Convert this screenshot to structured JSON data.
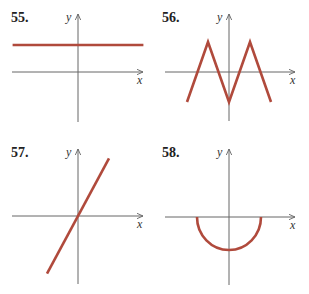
{
  "colors": {
    "curve": "#b04a3c",
    "axis": "#666666",
    "text": "#222222"
  },
  "chart_data": [
    {
      "type": "line",
      "panel_label": "55.",
      "xlabel": "x",
      "ylabel": "y",
      "description": "horizontal line above the x-axis",
      "xlim": [
        -3,
        3
      ],
      "ylim": [
        -2,
        2
      ],
      "points": [
        [
          -3,
          1
        ],
        [
          3,
          1
        ]
      ],
      "grid": false
    },
    {
      "type": "line",
      "panel_label": "56.",
      "xlabel": "x",
      "ylabel": "y",
      "description": "zigzag (M-shaped) piecewise linear graph",
      "xlim": [
        -3,
        3
      ],
      "ylim": [
        -2,
        2
      ],
      "points": [
        [
          -2,
          -1
        ],
        [
          -1,
          1
        ],
        [
          0,
          -1
        ],
        [
          1,
          1
        ],
        [
          2,
          -1
        ]
      ],
      "grid": false
    },
    {
      "type": "line",
      "panel_label": "57.",
      "xlabel": "x",
      "ylabel": "y",
      "description": "straight line through the origin with positive slope",
      "xlim": [
        -3,
        3
      ],
      "ylim": [
        -2.5,
        2.5
      ],
      "points": [
        [
          -1,
          -1.8
        ],
        [
          1,
          1.8
        ]
      ],
      "grid": false
    },
    {
      "type": "line",
      "panel_label": "58.",
      "xlabel": "x",
      "ylabel": "y",
      "description": "lower semicircle centered at origin",
      "xlim": [
        -3,
        3
      ],
      "ylim": [
        -2.5,
        2.5
      ],
      "semicircle": {
        "center": [
          0,
          0
        ],
        "radius": 1,
        "half": "lower"
      },
      "grid": false
    }
  ]
}
